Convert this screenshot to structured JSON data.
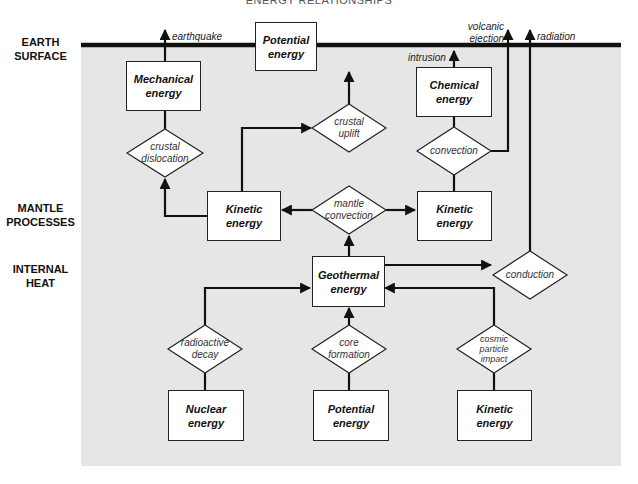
{
  "title": "ENERGY RELATIONSHIPS",
  "zones": {
    "earth_surface": [
      "EARTH",
      "SURFACE"
    ],
    "mantle_processes": [
      "MANTLE",
      "PROCESSES"
    ],
    "internal_heat": [
      "INTERNAL",
      "HEAT"
    ]
  },
  "boxes": {
    "mechanical": [
      "Mechanical",
      "energy"
    ],
    "potential_top": [
      "Potential",
      "energy"
    ],
    "chemical": [
      "Chemical",
      "energy"
    ],
    "kinetic_left": [
      "Kinetic",
      "energy"
    ],
    "kinetic_right": [
      "Kinetic",
      "energy"
    ],
    "geothermal": [
      "Geothermal",
      "energy"
    ],
    "nuclear": [
      "Nuclear",
      "energy"
    ],
    "potential_bottom": [
      "Potential",
      "energy"
    ],
    "kinetic_bottom": [
      "Kinetic",
      "energy"
    ]
  },
  "processes": {
    "crustal_dislocation": [
      "crustal",
      "dislocation"
    ],
    "crustal_uplift": [
      "crustal",
      "uplift"
    ],
    "convection": [
      "convection"
    ],
    "mantle_convection": [
      "mantle",
      "convection"
    ],
    "conduction": [
      "conduction"
    ],
    "radioactive_decay": [
      "radioactive",
      "decay"
    ],
    "core_formation": [
      "core",
      "formation"
    ],
    "cosmic_particle_impact": [
      "cosmic",
      "particle",
      "impact"
    ]
  },
  "outputs": {
    "earthquake": "earthquake",
    "intrusion": "intrusion",
    "volcanic_ejection": [
      "volcanic",
      "ejection"
    ],
    "radiation": "radiation"
  },
  "colors": {
    "background_region": "#e6e6e6",
    "line": "#111111",
    "box_fill": "#ffffff"
  }
}
